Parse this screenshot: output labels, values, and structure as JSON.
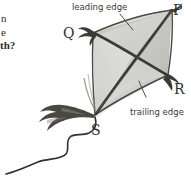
{
  "figure": {
    "kind": "hand-drawn-kite-diagram",
    "background_color": "#ffffff",
    "ink_color": "#3a3a38",
    "fabric_color_light": "#d9d9d6",
    "fabric_color_mid": "#c9c9c5",
    "fabric_color_dark": "#bdbdb8",
    "spar_color": "#46443f"
  },
  "margin_text": {
    "fragment_1": "n",
    "fragment_2": "e",
    "fragment_3": "th?"
  },
  "annotations": [
    {
      "id": "leading",
      "label": "leading edge"
    },
    {
      "id": "trailing",
      "label": "trailing edge"
    }
  ],
  "vertices": [
    {
      "id": "P",
      "label": "P",
      "position": "top-right"
    },
    {
      "id": "Q",
      "label": "Q",
      "position": "upper-left"
    },
    {
      "id": "R",
      "label": "R",
      "position": "right"
    },
    {
      "id": "S",
      "label": "S",
      "position": "bottom"
    }
  ],
  "parts": {
    "tail_bow": "tail-bow",
    "tail_string": "tail-string",
    "spar_pq_s": "long-spar",
    "spar_q_r": "cross-spar",
    "tuft_q": "ribbon-tuft-q",
    "tuft_r": "ribbon-tuft-r",
    "tuft_p": "ribbon-tuft-p"
  }
}
